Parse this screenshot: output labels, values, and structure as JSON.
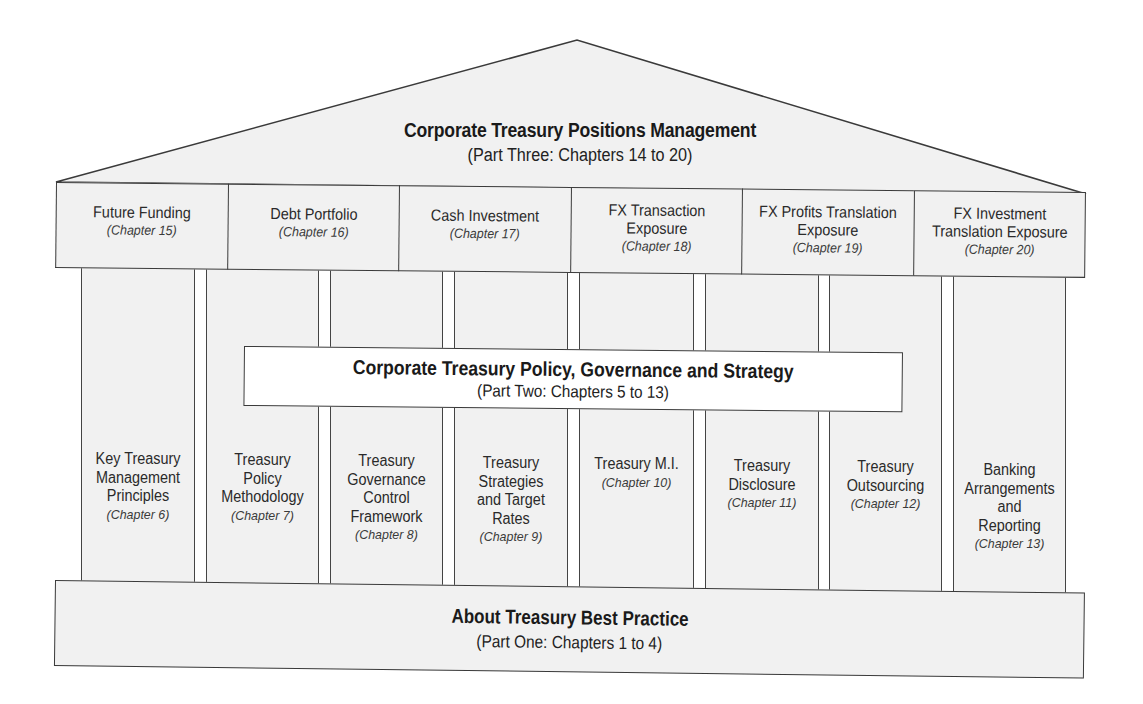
{
  "roof": {
    "title": "Corporate Treasury Positions Management",
    "subtitle": "(Part Three: Chapters 14 to 20)"
  },
  "frieze": [
    {
      "name": "Future Funding",
      "chapter": "(Chapter 15)"
    },
    {
      "name": "Debt Portfolio",
      "chapter": "(Chapter 16)"
    },
    {
      "name": "Cash Investment",
      "chapter": "(Chapter 17)"
    },
    {
      "name": "FX Transaction Exposure",
      "chapter": "(Chapter 18)"
    },
    {
      "name": "FX Profits Translation Exposure",
      "chapter": "(Chapter 19)"
    },
    {
      "name": "FX Investment Translation Exposure",
      "chapter": "(Chapter 20)"
    }
  ],
  "frieze_lines": [
    [
      "Future Funding"
    ],
    [
      "Debt Portfolio"
    ],
    [
      "Cash Investment"
    ],
    [
      "FX Transaction",
      "Exposure"
    ],
    [
      "FX Profits Translation",
      "Exposure"
    ],
    [
      "FX Investment",
      "Translation Exposure"
    ]
  ],
  "banner": {
    "title": "Corporate Treasury Policy, Governance and Strategy",
    "subtitle": "(Part Two: Chapters 5 to 13)"
  },
  "columns": [
    {
      "name": "Key Treasury\nManagement\nPrinciples",
      "chapter": "(Chapter 6)"
    },
    {
      "name": "Treasury\nPolicy\nMethodology",
      "chapter": "(Chapter 7)"
    },
    {
      "name": "Treasury\nGovernance\nControl\nFramework",
      "chapter": "(Chapter 8)"
    },
    {
      "name": "Treasury\nStrategies\nand Target\nRates",
      "chapter": "(Chapter 9)"
    },
    {
      "name": "Treasury M.I.",
      "chapter": "(Chapter 10)"
    },
    {
      "name": "Treasury\nDisclosure",
      "chapter": "(Chapter 11)"
    },
    {
      "name": "Treasury\nOutsourcing",
      "chapter": "(Chapter 12)"
    },
    {
      "name": "Banking\nArrangements\nand\nReporting",
      "chapter": "(Chapter 13)"
    }
  ],
  "foundation": {
    "title": "About Treasury Best Practice",
    "subtitle": "(Part One: Chapters 1 to 4)"
  },
  "colors": {
    "fill": "#f1f1f1",
    "stroke": "#3a3a3a",
    "banner_fill": "#ffffff",
    "text": "#1a1a1a"
  }
}
